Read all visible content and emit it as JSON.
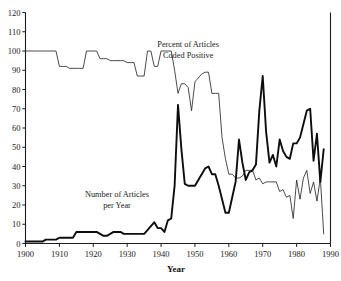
{
  "chart_data": {
    "type": "line",
    "title": "",
    "xlabel": "Year",
    "ylabel": "",
    "xlim": [
      1900,
      1990
    ],
    "ylim": [
      0,
      120
    ],
    "xticks": [
      1900,
      1910,
      1920,
      1930,
      1940,
      1950,
      1960,
      1970,
      1980,
      1990
    ],
    "yticks": [
      0,
      10,
      20,
      30,
      40,
      50,
      60,
      70,
      80,
      90,
      100,
      110,
      120
    ],
    "grid": false,
    "legend": "annotations-inline",
    "annotations": [
      {
        "name": "percent-series-label",
        "lines": [
          "Percent of Articles",
          "Coded Positive"
        ],
        "x": 1948,
        "y": 102
      },
      {
        "name": "count-series-label",
        "lines": [
          "Number of Articles",
          "per Year"
        ],
        "x": 1927,
        "y": 24
      }
    ],
    "x": [
      1900,
      1901,
      1902,
      1903,
      1904,
      1905,
      1906,
      1907,
      1908,
      1909,
      1910,
      1911,
      1912,
      1913,
      1914,
      1915,
      1916,
      1917,
      1918,
      1919,
      1920,
      1921,
      1922,
      1923,
      1924,
      1925,
      1926,
      1927,
      1928,
      1929,
      1930,
      1931,
      1932,
      1933,
      1934,
      1935,
      1936,
      1937,
      1938,
      1939,
      1940,
      1941,
      1942,
      1943,
      1944,
      1945,
      1946,
      1947,
      1948,
      1949,
      1950,
      1951,
      1952,
      1953,
      1954,
      1955,
      1956,
      1957,
      1958,
      1959,
      1960,
      1961,
      1962,
      1963,
      1964,
      1965,
      1966,
      1967,
      1968,
      1969,
      1970,
      1971,
      1972,
      1973,
      1974,
      1975,
      1976,
      1977,
      1978,
      1979,
      1980,
      1981,
      1982,
      1983,
      1984,
      1985,
      1986,
      1987,
      1988
    ],
    "series": [
      {
        "name": "Percent of Articles Coded Positive",
        "style": "thin",
        "values": [
          100,
          100,
          100,
          100,
          100,
          100,
          100,
          100,
          100,
          100,
          92,
          92,
          92,
          91,
          91,
          91,
          91,
          91,
          100,
          100,
          100,
          100,
          96,
          96,
          96,
          95,
          95,
          95,
          95,
          95,
          94,
          94,
          94,
          87,
          87,
          87,
          100,
          100,
          92,
          92,
          100,
          100,
          100,
          100,
          90,
          78,
          83,
          83,
          81,
          69,
          84,
          86,
          88,
          89,
          89,
          78,
          78,
          78,
          55,
          44,
          36,
          36,
          34,
          34,
          35,
          38,
          38,
          38,
          33,
          34,
          31,
          32,
          32,
          32,
          32,
          27,
          28,
          24,
          25,
          13,
          33,
          23,
          34,
          38,
          26,
          32,
          22,
          34,
          5
        ]
      },
      {
        "name": "Number of Articles per Year",
        "style": "thick",
        "values": [
          1,
          1,
          1,
          1,
          1,
          1,
          2,
          2,
          2,
          2,
          3,
          3,
          3,
          3,
          3,
          6,
          6,
          6,
          6,
          6,
          6,
          6,
          5,
          4,
          4,
          5,
          6,
          6,
          6,
          5,
          5,
          5,
          5,
          5,
          5,
          5,
          7,
          9,
          11,
          8,
          8,
          6,
          12,
          13,
          30,
          72,
          49,
          31,
          30,
          30,
          30,
          33,
          36,
          39,
          40,
          36,
          36,
          30,
          23,
          16,
          16,
          24,
          32,
          54,
          42,
          33,
          37,
          38,
          41,
          69,
          87,
          58,
          42,
          46,
          40,
          54,
          48,
          45,
          44,
          52,
          52,
          55,
          62,
          69,
          70,
          43,
          57,
          32,
          49
        ]
      }
    ]
  },
  "axes": {
    "x_title": "Year"
  }
}
